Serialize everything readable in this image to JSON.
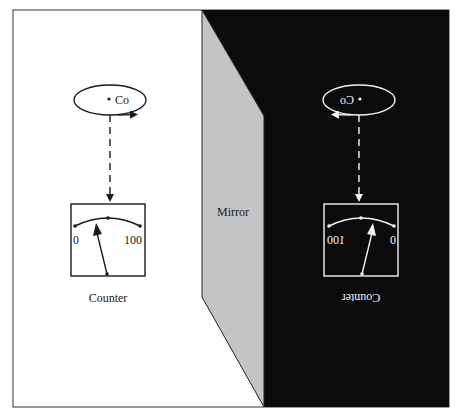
{
  "figure": {
    "mirror_label": "Mirror",
    "real_side": {
      "charge_label": "Co",
      "meter": {
        "scale_min": "0",
        "scale_max": "100",
        "label": "Counter"
      }
    },
    "mirror_side": {
      "charge_label": "Co",
      "meter": {
        "scale_min": "0",
        "scale_max": "100",
        "label": "Counter"
      }
    }
  },
  "colors": {
    "background": "#ffffff",
    "mirror_fill": "#c4c4c4",
    "mirror_world": "#0b0b0b",
    "ink": "#1a1a1a",
    "mirror_ink": "#f2f2f2"
  }
}
